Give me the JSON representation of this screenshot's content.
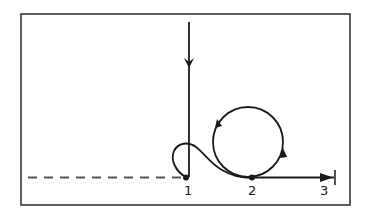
{
  "diagram": {
    "colors": {
      "ink": "#1a1a1a",
      "frame": "#2a2a2a",
      "background": "#ffffff"
    },
    "points": [
      {
        "id": "1",
        "label": "1"
      },
      {
        "id": "2",
        "label": "2"
      },
      {
        "id": "3",
        "label": "3"
      }
    ],
    "elements": {
      "incoming_vertical_line": "arrow pointing down into point 1",
      "loop": "small loop left of point 1 connecting to circle",
      "circle": "closed circular path with counter-clockwise arrows",
      "baseline_dashed": "dashed horizontal line up to point 1",
      "outgoing_line": "solid arrow from point 2 to point 3"
    }
  }
}
